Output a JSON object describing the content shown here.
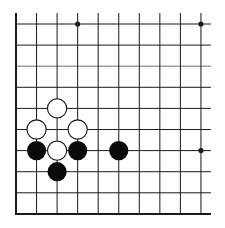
{
  "board": {
    "view": "bottom-left corner",
    "columns": 10,
    "rows": 10,
    "origin_x": 16,
    "origin_y": 24,
    "spacing_x": 20.55,
    "spacing_y": 21.1,
    "line_extend_top": 11,
    "line_extend_right": 10,
    "edges": [
      "left",
      "bottom"
    ],
    "line_color": "#1a1a1a",
    "edge_line_width": 2,
    "grid_line_width": 1,
    "faded_rows": [
      2
    ],
    "faded_line_color": "#6e6e6e",
    "background": "#ffffff"
  },
  "star_points": [
    {
      "col": 3,
      "row": 0
    },
    {
      "col": 9,
      "row": 0
    },
    {
      "col": 9,
      "row": 6
    }
  ],
  "stones": [
    {
      "color": "white",
      "col": 2,
      "row": 4
    },
    {
      "color": "white",
      "col": 1,
      "row": 5
    },
    {
      "color": "white",
      "col": 3,
      "row": 5
    },
    {
      "color": "black",
      "col": 1,
      "row": 6
    },
    {
      "color": "white",
      "col": 2,
      "row": 6
    },
    {
      "color": "black",
      "col": 3,
      "row": 6
    },
    {
      "color": "black",
      "col": 5,
      "row": 6
    },
    {
      "color": "black",
      "col": 2,
      "row": 7
    }
  ],
  "stone_style": {
    "radius": 9.6,
    "black_fill": "#0a0a0a",
    "white_fill": "#ffffff",
    "white_stroke": "#111111",
    "white_stroke_width": 1.1
  },
  "star_point_radius": 2.6
}
